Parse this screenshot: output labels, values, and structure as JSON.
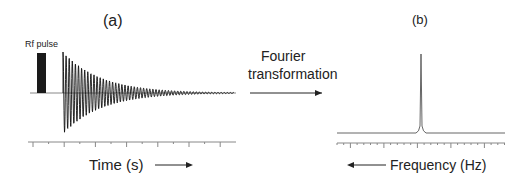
{
  "panel_a": {
    "label": "(a)",
    "pulse_label": "Rf pulse",
    "xlabel": "Time (s)"
  },
  "middle": {
    "line1": "Fourier",
    "line2": "transformation"
  },
  "panel_b": {
    "label": "(b)",
    "xlabel": "Frequency (Hz)"
  },
  "colors": {
    "ink": "#222222",
    "axis": "#777777"
  },
  "chart_data": [
    {
      "type": "line",
      "title": "(a)",
      "description": "Free induction decay (FID) signal following an RF pulse",
      "xlabel": "Time (s)",
      "ylabel": "",
      "annotations": [
        "Rf pulse"
      ],
      "grid": false
    },
    {
      "type": "line",
      "title": "(b)",
      "description": "Frequency spectrum with a single sharp peak",
      "xlabel": "Frequency (Hz)",
      "ylabel": "",
      "grid": false
    }
  ]
}
